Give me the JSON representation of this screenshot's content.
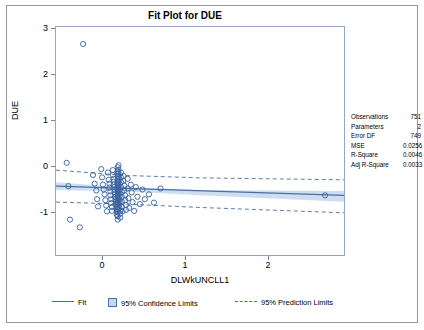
{
  "title": "Fit Plot for DUE",
  "chart_data": {
    "type": "scatter",
    "title": "Fit Plot for DUE",
    "xlabel": "DLWkUNCLL1",
    "ylabel": "DUE",
    "xlim": [
      -0.75,
      2.75
    ],
    "ylim": [
      -1.35,
      3.35
    ],
    "xticks": [
      0,
      1,
      2
    ],
    "yticks": [
      -1,
      0,
      1,
      2,
      3
    ],
    "grid": false,
    "legend_position": "bottom",
    "series": [
      {
        "name": "Fit",
        "type": "line",
        "color": "#4a6fa5",
        "points": [
          [
            -0.75,
            0.07
          ],
          [
            2.75,
            -0.12
          ]
        ]
      },
      {
        "name": "95% Confidence Limits",
        "type": "band",
        "color": "#c5d8ef",
        "upper": [
          [
            -0.75,
            0.15
          ],
          [
            0.1,
            0.04
          ],
          [
            1.0,
            -0.01
          ],
          [
            2.75,
            -0.03
          ]
        ],
        "lower": [
          [
            -0.75,
            -0.01
          ],
          [
            0.1,
            -0.04
          ],
          [
            1.0,
            -0.12
          ],
          [
            2.75,
            -0.25
          ]
        ]
      },
      {
        "name": "95% Prediction Limits",
        "type": "dashed-band",
        "color": "#4a6fa5",
        "upper": [
          [
            -0.75,
            0.4
          ],
          [
            0.1,
            0.29
          ],
          [
            1.0,
            0.24
          ],
          [
            2.75,
            0.2
          ]
        ],
        "lower": [
          [
            -0.75,
            -0.26
          ],
          [
            0.1,
            -0.3
          ],
          [
            1.0,
            -0.37
          ],
          [
            2.75,
            -0.48
          ]
        ]
      },
      {
        "name": "Observations",
        "type": "scatter",
        "marker": "open-circle",
        "color": "#36619e",
        "points": [
          [
            -0.42,
            3.0
          ],
          [
            -0.62,
            0.55
          ],
          [
            -0.6,
            0.07
          ],
          [
            -0.58,
            -0.62
          ],
          [
            -0.46,
            -0.78
          ],
          [
            -0.3,
            0.3
          ],
          [
            -0.28,
            0.12
          ],
          [
            -0.26,
            -0.02
          ],
          [
            -0.25,
            -0.2
          ],
          [
            -0.24,
            -0.35
          ],
          [
            -0.2,
            0.42
          ],
          [
            -0.19,
            0.25
          ],
          [
            -0.18,
            0.1
          ],
          [
            -0.17,
            0.0
          ],
          [
            -0.16,
            -0.1
          ],
          [
            -0.15,
            -0.22
          ],
          [
            -0.14,
            -0.33
          ],
          [
            -0.13,
            -0.45
          ],
          [
            -0.12,
            0.35
          ],
          [
            -0.11,
            0.2
          ],
          [
            -0.1,
            0.12
          ],
          [
            -0.1,
            0.04
          ],
          [
            -0.09,
            -0.04
          ],
          [
            -0.09,
            -0.12
          ],
          [
            -0.08,
            -0.2
          ],
          [
            -0.08,
            -0.28
          ],
          [
            -0.07,
            -0.36
          ],
          [
            -0.07,
            -0.44
          ],
          [
            -0.06,
            0.4
          ],
          [
            -0.06,
            0.3
          ],
          [
            -0.05,
            0.22
          ],
          [
            -0.05,
            0.16
          ],
          [
            -0.05,
            0.1
          ],
          [
            -0.04,
            0.05
          ],
          [
            -0.04,
            0.0
          ],
          [
            -0.04,
            -0.05
          ],
          [
            -0.03,
            -0.1
          ],
          [
            -0.03,
            -0.15
          ],
          [
            -0.03,
            -0.2
          ],
          [
            -0.02,
            -0.25
          ],
          [
            -0.02,
            -0.3
          ],
          [
            -0.02,
            -0.35
          ],
          [
            -0.01,
            -0.4
          ],
          [
            -0.01,
            -0.45
          ],
          [
            -0.01,
            -0.52
          ],
          [
            0.0,
            0.46
          ],
          [
            0.0,
            0.38
          ],
          [
            0.0,
            0.32
          ],
          [
            0.0,
            0.26
          ],
          [
            0.0,
            0.21
          ],
          [
            0.0,
            0.17
          ],
          [
            0.0,
            0.13
          ],
          [
            0.0,
            0.09
          ],
          [
            0.0,
            0.05
          ],
          [
            0.0,
            0.01
          ],
          [
            0.0,
            -0.03
          ],
          [
            0.0,
            -0.07
          ],
          [
            0.0,
            -0.11
          ],
          [
            0.0,
            -0.15
          ],
          [
            0.0,
            -0.19
          ],
          [
            0.0,
            -0.23
          ],
          [
            0.0,
            -0.27
          ],
          [
            0.0,
            -0.31
          ],
          [
            0.0,
            -0.36
          ],
          [
            0.0,
            -0.41
          ],
          [
            0.0,
            -0.47
          ],
          [
            0.0,
            -0.55
          ],
          [
            0.0,
            -0.62
          ],
          [
            0.01,
            0.5
          ],
          [
            0.01,
            0.41
          ],
          [
            0.01,
            0.34
          ],
          [
            0.01,
            0.28
          ],
          [
            0.01,
            0.22
          ],
          [
            0.01,
            0.16
          ],
          [
            0.01,
            0.1
          ],
          [
            0.01,
            0.04
          ],
          [
            0.02,
            -0.02
          ],
          [
            0.02,
            -0.08
          ],
          [
            0.02,
            -0.14
          ],
          [
            0.02,
            -0.2
          ],
          [
            0.02,
            -0.26
          ],
          [
            0.02,
            -0.32
          ],
          [
            0.02,
            -0.38
          ],
          [
            0.03,
            -0.44
          ],
          [
            0.03,
            -0.5
          ],
          [
            0.03,
            -0.58
          ],
          [
            0.04,
            0.35
          ],
          [
            0.04,
            0.25
          ],
          [
            0.04,
            0.15
          ],
          [
            0.04,
            0.05
          ],
          [
            0.05,
            -0.05
          ],
          [
            0.05,
            -0.15
          ],
          [
            0.05,
            -0.25
          ],
          [
            0.05,
            -0.35
          ],
          [
            0.06,
            -0.45
          ],
          [
            0.07,
            0.28
          ],
          [
            0.07,
            0.18
          ],
          [
            0.08,
            0.08
          ],
          [
            0.08,
            -0.02
          ],
          [
            0.09,
            -0.12
          ],
          [
            0.09,
            -0.22
          ],
          [
            0.1,
            -0.32
          ],
          [
            0.1,
            -0.42
          ],
          [
            0.12,
            0.22
          ],
          [
            0.12,
            0.02
          ],
          [
            0.13,
            -0.18
          ],
          [
            0.14,
            -0.38
          ],
          [
            0.16,
            0.1
          ],
          [
            0.17,
            -0.06
          ],
          [
            0.18,
            -0.26
          ],
          [
            0.2,
            -0.44
          ],
          [
            0.22,
            0.05
          ],
          [
            0.24,
            -0.15
          ],
          [
            0.27,
            -0.3
          ],
          [
            0.3,
            0.0
          ],
          [
            0.33,
            -0.2
          ],
          [
            0.38,
            -0.1
          ],
          [
            0.44,
            -0.27
          ],
          [
            0.52,
            0.02
          ],
          [
            2.52,
            -0.12
          ]
        ]
      }
    ]
  },
  "stats": {
    "rows": [
      {
        "key": "Observations",
        "value": "751"
      },
      {
        "key": "Parameters",
        "value": "2"
      },
      {
        "key": "Error DF",
        "value": "749"
      },
      {
        "key": "MSE",
        "value": "0.0256"
      },
      {
        "key": "R-Square",
        "value": "0.0046"
      },
      {
        "key": "Adj R-Square",
        "value": "0.0033"
      }
    ]
  },
  "legend": {
    "fit": "Fit",
    "confidence": "95% Confidence Limits",
    "prediction": "95% Prediction Limits"
  },
  "axes": {
    "ylabel": "DUE",
    "xlabel": "DLWkUNCLL1",
    "yticks": [
      "3",
      "2",
      "1",
      "0",
      "-1"
    ],
    "xticks": [
      "0",
      "1",
      "2"
    ]
  }
}
